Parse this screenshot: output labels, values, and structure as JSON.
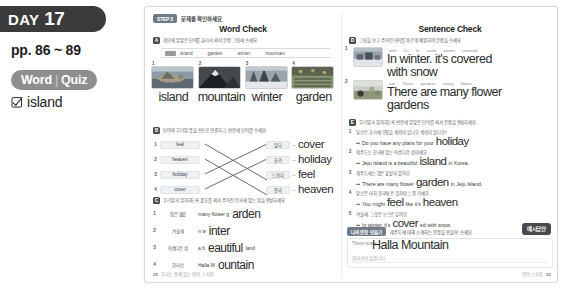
{
  "sidebar": {
    "day_label": "DAY",
    "day_number": "17",
    "pages": "pp. 86 ~ 89",
    "quiz_badge_word": "Word",
    "quiz_badge_sep": "|",
    "quiz_badge_quiz": "Quiz",
    "quiz_item": "island"
  },
  "book": {
    "step_chip": "STEP 3",
    "step_ko": "문제를 확인하세요",
    "left": {
      "title": "Word Check",
      "sectionA": {
        "marker": "A",
        "ko": "네모에 알맞은 단어를 골라서 써서 문장 그림에 쓰세요.",
        "wordbank": [
          "island",
          "garden",
          "winter",
          "mountain"
        ],
        "items": [
          {
            "num": "1",
            "picture": "island-photo",
            "answer": "island"
          },
          {
            "num": "2",
            "picture": "mountain-photo",
            "answer": "mountain"
          },
          {
            "num": "3",
            "picture": "winter-photo",
            "answer": "winter"
          },
          {
            "num": "4",
            "picture": "garden-photo",
            "answer": "garden"
          }
        ]
      },
      "sectionB": {
        "marker": "B",
        "ko": "단어와 우리말 뜻을 선으로 연결하고, 빈칸에 단어를 쓰세요.",
        "rows": [
          {
            "num": "1",
            "word": "feel",
            "ko": "덮다",
            "answer": "cover"
          },
          {
            "num": "2",
            "word": "heaven",
            "ko": "휴가",
            "answer": "holiday"
          },
          {
            "num": "3",
            "word": "holiday",
            "ko": "느끼다",
            "answer": "feel"
          },
          {
            "num": "4",
            "word": "cover",
            "ko": "천국",
            "answer": "heaven"
          }
        ]
      },
      "sectionC": {
        "marker": "C",
        "ko": "우리말과 일치하도록 괄호를 써서 주어진 문자에 맞는 말을 완성하세요.",
        "rows": [
          {
            "num": "1",
            "ko": "많은 꽃밭",
            "pre": "many flower g",
            "hand": "arden",
            "post": ""
          },
          {
            "num": "2",
            "ko": "겨울에",
            "pre": "n w",
            "hand": "inter",
            "post": ""
          },
          {
            "num": "3",
            "ko": "아름다운 섬",
            "pre": "a b",
            "hand": "eautiful",
            "post": "land"
          },
          {
            "num": "4",
            "ko": "한라산",
            "pre": "Halla M",
            "hand": "ountain",
            "post": ""
          }
        ]
      },
      "footer": {
        "page": "25",
        "note": "우리는 함께 읽는 영어 스피킹"
      }
    },
    "right": {
      "title": "Sentence Check",
      "sectionD": {
        "marker": "D",
        "ko": "그림을 보고 주어진 단어를 바르게 배열하여 문장을 쓰세요.",
        "items": [
          {
            "num": "1",
            "picture": "snow-village-photo",
            "scrambled": [
              "with",
              "it's",
              "In",
              "snow",
              "winter",
              "covered"
            ],
            "answer_line1": "In winter. it's covered",
            "answer_line2": "with snow"
          },
          {
            "num": "2",
            "picture": "flower-garden-photo",
            "scrambled": [
              "are",
              "There",
              "gardens",
              "many",
              "flower"
            ],
            "answer_line1": "There are many flower",
            "answer_line2": "gardens"
          }
        ]
      },
      "sectionE": {
        "marker": "E",
        "ko": "우리말과 일치하도록 빈칸에 알맞은 단어를 써서 문장을 완성하세요.",
        "rows": [
          {
            "num": "1",
            "ko": "당신은 휴가에 무엇을 계획이 있나요 계획이 있나요?",
            "pre": "Do you have any plans for your",
            "hand": "holiday",
            "post": ""
          },
          {
            "num": "2",
            "ko": "제주도는 한국에 있는 아름다운 섬이에요.",
            "pre": "Jeju Island is a beautiful",
            "hand": "island",
            "post": "in Korea."
          },
          {
            "num": "3",
            "ko": "제주도에는 많은 꽃밭이 있어요.",
            "pre": "There are many flower",
            "hand": "garden",
            "post": "in Jeju Island."
          },
          {
            "num": "4",
            "ko": "당신은 마치 천국에 온 것처럼 느낄 거예요.",
            "pre": "You might",
            "hand": "feel",
            "mid": "like it's",
            "hand2": "heaven",
            "post": ""
          },
          {
            "num": "5",
            "ko": "겨울에, 그것은 눈으로 덮여요.",
            "pre": "In winter, it's",
            "hand": "cover",
            "post": "ed with snow."
          }
        ]
      },
      "writebox": {
        "tag": "나의 문장 만들기",
        "ko": "제주도에 대해 소개하는 문장을 만들어 쓰세요.",
        "line1_pre": "There is/are",
        "line1_hand": "Halla Mountain",
        "line2": "한라산이 있습니다.",
        "example_badge": "예시답안"
      },
      "footer": {
        "page": "25",
        "note": "영어 스피킹"
      }
    }
  },
  "icons": {
    "checkbox": "checkbox-checked-icon"
  },
  "colors": {
    "banner": "#3b3b3b",
    "badge_gray": "#8e8e8e",
    "step_chip": "#6f7b86",
    "hand_ink": "#2b2b2b",
    "box_fill": "#eef1f4"
  }
}
